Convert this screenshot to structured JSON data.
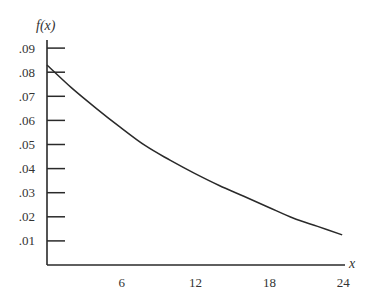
{
  "chart_data": {
    "type": "line",
    "title": "",
    "xlabel": "x",
    "ylabel": "f(x)",
    "xlim": [
      0,
      25
    ],
    "ylim": [
      0,
      0.095
    ],
    "grid": false,
    "legend": null,
    "x_ticks": [
      6,
      12,
      18,
      24
    ],
    "x_tick_labels": [
      "6",
      "12",
      "18",
      "24"
    ],
    "y_ticks": [
      0.01,
      0.02,
      0.03,
      0.04,
      0.05,
      0.06,
      0.07,
      0.08,
      0.09
    ],
    "y_tick_labels": [
      ".01",
      ".02",
      ".03",
      ".04",
      ".05",
      ".06",
      ".07",
      ".08",
      ".09"
    ],
    "series": [
      {
        "name": "f(x)",
        "x": [
          0,
          2,
          4,
          6,
          8,
          10,
          12,
          14,
          16,
          18,
          20,
          22,
          24
        ],
        "values": [
          0.083,
          0.0735,
          0.065,
          0.057,
          0.0495,
          0.0435,
          0.038,
          0.033,
          0.0285,
          0.024,
          0.0195,
          0.016,
          0.0125
        ]
      }
    ],
    "colors": {
      "line": "#2a2a2a",
      "axis": "#2a2a2a"
    }
  }
}
